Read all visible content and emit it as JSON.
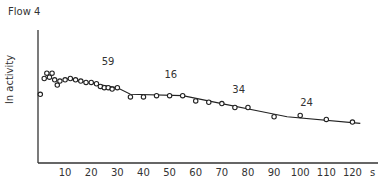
{
  "chart_data": {
    "type": "scatter",
    "title": "Flow 4",
    "xlabel": "s",
    "ylabel": "ln activity",
    "xlim": [
      0,
      125
    ],
    "x_ticks": [
      10,
      20,
      30,
      40,
      50,
      60,
      70,
      80,
      90,
      100,
      110,
      120
    ],
    "grid": false,
    "legend": null,
    "y_units": "relative (no tick labels shown; higher = more activity)",
    "series": [
      {
        "name": "measured points",
        "marker": "open-circle",
        "points": [
          {
            "x": 0.5,
            "y": 74
          },
          {
            "x": 2,
            "y": 86
          },
          {
            "x": 3,
            "y": 90
          },
          {
            "x": 4,
            "y": 87
          },
          {
            "x": 5,
            "y": 90
          },
          {
            "x": 6,
            "y": 85
          },
          {
            "x": 7,
            "y": 81
          },
          {
            "x": 8,
            "y": 84
          },
          {
            "x": 10,
            "y": 85
          },
          {
            "x": 12,
            "y": 86
          },
          {
            "x": 14,
            "y": 85
          },
          {
            "x": 16,
            "y": 84
          },
          {
            "x": 18,
            "y": 83
          },
          {
            "x": 20,
            "y": 83
          },
          {
            "x": 22,
            "y": 82
          },
          {
            "x": 23.5,
            "y": 80
          },
          {
            "x": 25,
            "y": 79
          },
          {
            "x": 26.5,
            "y": 79
          },
          {
            "x": 28,
            "y": 78
          },
          {
            "x": 30,
            "y": 79
          },
          {
            "x": 35,
            "y": 72
          },
          {
            "x": 40,
            "y": 72
          },
          {
            "x": 45,
            "y": 73
          },
          {
            "x": 50,
            "y": 73
          },
          {
            "x": 55,
            "y": 73
          },
          {
            "x": 60,
            "y": 69
          },
          {
            "x": 65,
            "y": 68
          },
          {
            "x": 70,
            "y": 67
          },
          {
            "x": 75,
            "y": 64
          },
          {
            "x": 80,
            "y": 64
          },
          {
            "x": 90,
            "y": 57
          },
          {
            "x": 100,
            "y": 58
          },
          {
            "x": 110,
            "y": 55
          },
          {
            "x": 120,
            "y": 53
          }
        ]
      },
      {
        "name": "fitted curve",
        "style": "line",
        "points": [
          {
            "x": 10,
            "y": 86
          },
          {
            "x": 30,
            "y": 79
          },
          {
            "x": 35,
            "y": 74
          },
          {
            "x": 55,
            "y": 73
          },
          {
            "x": 70,
            "y": 67
          },
          {
            "x": 85,
            "y": 61
          },
          {
            "x": 95,
            "y": 57
          },
          {
            "x": 123,
            "y": 52
          }
        ]
      }
    ],
    "annotations": [
      {
        "text": "59",
        "x": 24,
        "y": 96
      },
      {
        "text": "16",
        "x": 48,
        "y": 86
      },
      {
        "text": "34",
        "x": 74,
        "y": 75
      },
      {
        "text": "24",
        "x": 100,
        "y": 65
      }
    ]
  }
}
